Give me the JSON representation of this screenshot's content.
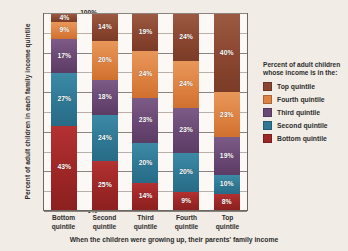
{
  "chart_data": {
    "type": "bar",
    "stacked": true,
    "title": "",
    "xlabel": "When the children were growing up, their parents' family income",
    "ylabel": "Percent of adult children in each family income quintile",
    "ylim": [
      0,
      100
    ],
    "ytick_labels": [
      "100%",
      "80%",
      "60%",
      "40%",
      "20%",
      "0%"
    ],
    "ytick_values": [
      100,
      80,
      60,
      40,
      20,
      0
    ],
    "grid": true,
    "minor_gridline_interval": 10,
    "legend_position": "right",
    "legend_title": "Percent of adult children whose income is in the:",
    "categories": [
      "Bottom quintile",
      "Second quintile",
      "Third quintile",
      "Fourth quintile",
      "Top quintile"
    ],
    "category_lines": [
      [
        "Bottom",
        "quintile"
      ],
      [
        "Second",
        "quintile"
      ],
      [
        "Third",
        "quintile"
      ],
      [
        "Fourth",
        "quintile"
      ],
      [
        "Top",
        "quintile"
      ]
    ],
    "series": [
      {
        "name": "Top quintile",
        "color": "#8a4630",
        "values": [
          4,
          14,
          19,
          24,
          40
        ],
        "labels": [
          "4%",
          "14%",
          "19%",
          "24%",
          "40%"
        ]
      },
      {
        "name": "Fourth quintile",
        "color": "#dd8242",
        "values": [
          9,
          20,
          24,
          24,
          23
        ],
        "labels": [
          "9%",
          "20%",
          "24%",
          "24%",
          "23%"
        ]
      },
      {
        "name": "Third quintile",
        "color": "#6a4874",
        "values": [
          17,
          18,
          23,
          23,
          19
        ],
        "labels": [
          "17%",
          "18%",
          "23%",
          "23%",
          "19%"
        ]
      },
      {
        "name": "Second quintile",
        "color": "#2f7894",
        "values": [
          27,
          24,
          20,
          20,
          10
        ],
        "labels": [
          "27%",
          "24%",
          "20%",
          "20%",
          "10%"
        ]
      },
      {
        "name": "Bottom quintile",
        "color": "#9d2626",
        "values": [
          43,
          25,
          14,
          9,
          8
        ],
        "labels": [
          "43%",
          "25%",
          "14%",
          "9%",
          "8%"
        ]
      }
    ]
  }
}
